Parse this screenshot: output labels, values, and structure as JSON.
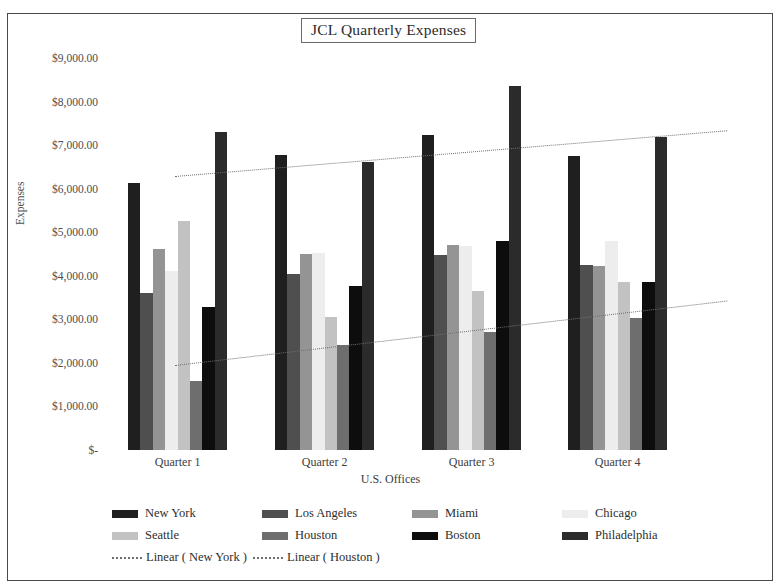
{
  "chart_data": {
    "type": "bar",
    "title": "JCL Quarterly Expenses",
    "xlabel": "U.S. Offices",
    "ylabel": "Expenses",
    "categories": [
      "Quarter 1",
      "Quarter 2",
      "Quarter 3",
      "Quarter 4"
    ],
    "ylim": [
      0,
      9000
    ],
    "ytick_values": [
      9000,
      8000,
      7000,
      6000,
      5000,
      4000,
      3000,
      2000,
      1000,
      0
    ],
    "ytick_labels": [
      "$9,000.00",
      "$8,000.00",
      "$7,000.00",
      "$6,000.00",
      "$5,000.00",
      "$4,000.00",
      "$3,000.00",
      "$2,000.00",
      "$1,000.00",
      "$-"
    ],
    "grid": false,
    "legend_position": "bottom",
    "series": [
      {
        "name": "New York",
        "color": "#1f1f1f",
        "values": [
          6130,
          6780,
          7240,
          6760
        ]
      },
      {
        "name": "Los Angeles",
        "color": "#4f4f4f",
        "values": [
          3600,
          4030,
          4470,
          4250
        ]
      },
      {
        "name": "Miami",
        "color": "#949494",
        "values": [
          4620,
          4500,
          4700,
          4230
        ]
      },
      {
        "name": "Chicago",
        "color": "#ededed",
        "values": [
          4120,
          4530,
          4690,
          4800
        ]
      },
      {
        "name": "Seattle",
        "color": "#c2c2c2",
        "values": [
          5260,
          3060,
          3650,
          3860
        ]
      },
      {
        "name": "Houston",
        "color": "#6e6e6e",
        "values": [
          1580,
          2420,
          2720,
          3030
        ]
      },
      {
        "name": "Boston",
        "color": "#0d0d0d",
        "values": [
          3280,
          3760,
          4790,
          3850
        ]
      },
      {
        "name": "Philadelphia",
        "color": "#2b2b2b",
        "values": [
          7310,
          6620,
          8350,
          7190
        ]
      }
    ],
    "trendlines": [
      {
        "name": "Linear ( New York )",
        "style": "dotted",
        "start": 6290,
        "end": 7340
      },
      {
        "name": "Linear ( Houston )",
        "style": "dotted",
        "start": 1950,
        "end": 3430
      }
    ]
  },
  "legend": {
    "rows": [
      [
        {
          "label": "New York",
          "swatch": "#1f1f1f"
        },
        {
          "label": "Los Angeles",
          "swatch": "#4f4f4f"
        },
        {
          "label": "Miami",
          "swatch": "#949494"
        },
        {
          "label": "Chicago",
          "swatch": "#ededed"
        }
      ],
      [
        {
          "label": "Seattle",
          "swatch": "#c2c2c2"
        },
        {
          "label": "Houston",
          "swatch": "#6e6e6e"
        },
        {
          "label": "Boston",
          "swatch": "#0d0d0d"
        },
        {
          "label": "Philadelphia",
          "swatch": "#2b2b2b"
        }
      ]
    ],
    "trend_items": [
      {
        "label": "Linear ( New York )"
      },
      {
        "label": "Linear ( Houston )"
      }
    ]
  }
}
